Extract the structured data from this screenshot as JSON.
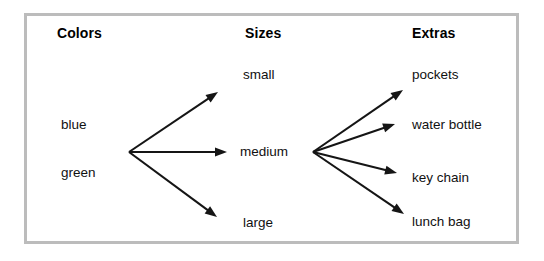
{
  "diagram": {
    "type": "tree-diagram",
    "title_visible": false,
    "border_color": "#bcbcbc",
    "line_color": "#151515",
    "background": "#ffffff",
    "columns": [
      {
        "id": "colors",
        "heading": "Colors",
        "heading_pos": {
          "x": 57,
          "y": 26
        },
        "items": [
          {
            "label": "blue",
            "x": 61,
            "y": 118
          },
          {
            "label": "green",
            "x": 61,
            "y": 166
          }
        ]
      },
      {
        "id": "sizes",
        "heading": "Sizes",
        "heading_pos": {
          "x": 245,
          "y": 26
        },
        "items": [
          {
            "label": "small",
            "x": 243,
            "y": 68
          },
          {
            "label": "medium",
            "x": 240,
            "y": 145
          },
          {
            "label": "large",
            "x": 243,
            "y": 216
          }
        ]
      },
      {
        "id": "extras",
        "heading": "Extras",
        "heading_pos": {
          "x": 412,
          "y": 26
        },
        "items": [
          {
            "label": "pockets",
            "x": 412,
            "y": 68
          },
          {
            "label": "water bottle",
            "x": 412,
            "y": 118
          },
          {
            "label": "key chain",
            "x": 412,
            "y": 171
          },
          {
            "label": "lunch bag",
            "x": 412,
            "y": 215
          }
        ]
      }
    ],
    "fans": [
      {
        "id": "colors-to-sizes",
        "origin": {
          "x": 129,
          "y": 152
        },
        "arrows": [
          {
            "to_label": "small",
            "tip": {
              "x": 218,
              "y": 92
            }
          },
          {
            "to_label": "medium",
            "tip": {
              "x": 227,
              "y": 152
            }
          },
          {
            "to_label": "large",
            "tip": {
              "x": 217,
              "y": 217
            }
          }
        ]
      },
      {
        "id": "sizes-to-extras",
        "origin": {
          "x": 313,
          "y": 152
        },
        "arrows": [
          {
            "to_label": "pockets",
            "tip": {
              "x": 403,
              "y": 90
            }
          },
          {
            "to_label": "water bottle",
            "tip": {
              "x": 395,
              "y": 124
            }
          },
          {
            "to_label": "key chain",
            "tip": {
              "x": 397,
              "y": 173
            }
          },
          {
            "to_label": "lunch bag",
            "tip": {
              "x": 404,
              "y": 214
            }
          }
        ]
      }
    ]
  }
}
